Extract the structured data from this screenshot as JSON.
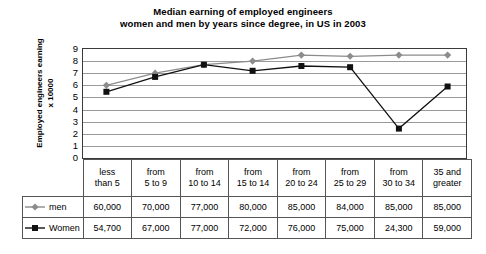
{
  "chart_data": {
    "type": "line",
    "title": "Median earning of employed engineers",
    "subtitle": "women and men by years since degree, in US in 2003",
    "xlabel": "",
    "ylabel": "Employed engineers earning x 10000",
    "ylabel_line1": "Employed engineers earning",
    "ylabel_line2": "x 10000",
    "ylim": [
      0,
      9
    ],
    "yticks": [
      9,
      8,
      7,
      6,
      5,
      4,
      3,
      2,
      1,
      0
    ],
    "grid": true,
    "legend_position": "table-left",
    "categories": [
      "less than 5",
      "from 5 to 9",
      "from 10 to 14",
      "from 15 to 14",
      "from 20 to 24",
      "from 25 to 29",
      "from 30 to 34",
      "35 and greater"
    ],
    "category_lines": [
      [
        "less",
        "than 5"
      ],
      [
        "from",
        "5 to 9"
      ],
      [
        "from",
        "10 to 14"
      ],
      [
        "from",
        "15 to 14"
      ],
      [
        "from",
        "20 to 24"
      ],
      [
        "from",
        "25 to 29"
      ],
      [
        "from",
        "30 to 34"
      ],
      [
        "35 and",
        "greater"
      ]
    ],
    "series": [
      {
        "name": "men",
        "color": "#8c8c8c",
        "marker": "diamond",
        "values": [
          60000,
          70000,
          77000,
          80000,
          85000,
          84000,
          85000,
          85000
        ],
        "labels": [
          "60,000",
          "70,000",
          "77,000",
          "80,000",
          "85,000",
          "84,000",
          "85,000",
          "85,000"
        ]
      },
      {
        "name": "Women",
        "color": "#111111",
        "marker": "square",
        "values": [
          54700,
          67000,
          77000,
          72000,
          76000,
          75000,
          24300,
          59000
        ],
        "labels": [
          "54,700",
          "67,000",
          "77,000",
          "72,000",
          "76,000",
          "75,000",
          "24,300",
          "59,000"
        ]
      }
    ]
  },
  "colors": {
    "men": "#8c8c8c",
    "women": "#111111",
    "grid": "#9a9a9a",
    "frame": "#3a3a3a",
    "table_border": "#555555"
  }
}
